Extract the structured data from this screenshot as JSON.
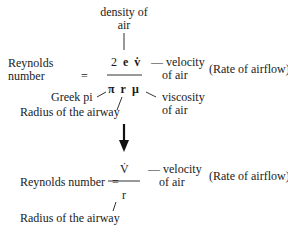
{
  "top": {
    "density_label_1": "density of",
    "density_label_2": "air",
    "lhs_1": "Reynolds",
    "lhs_2": "number",
    "equals": "=",
    "numerator": [
      "2",
      "e",
      "v̇"
    ],
    "denominator": [
      "π",
      "r",
      "μ"
    ],
    "velocity_label_1": "— velocity",
    "velocity_label_2": "of air",
    "rate_note": "(Rate of airflow)",
    "pi_label": "Greek pi",
    "radius_label": "Radius of the airway",
    "viscosity_label_1": "viscosity",
    "viscosity_label_2": "of air"
  },
  "bottom": {
    "lhs": "Reynolds number",
    "equals": "=",
    "numerator": "V̇",
    "denominator": "r",
    "velocity_label_1": "— velocity",
    "velocity_label_2": "of air",
    "rate_note": "(Rate of airflow)",
    "radius_label": "Radius of the airway"
  }
}
